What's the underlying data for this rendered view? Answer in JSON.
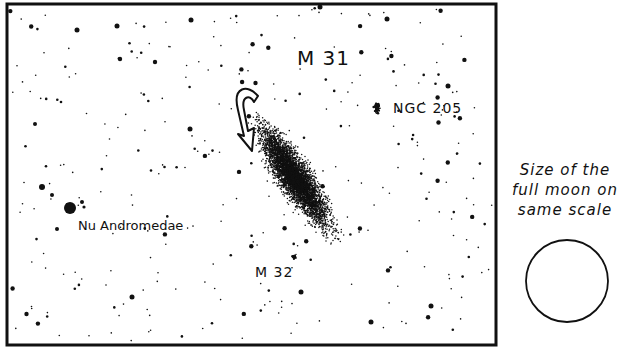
{
  "chart": {
    "labels": {
      "m31": "M 31",
      "ngc205": "NGC 205",
      "nu_andromedae": "Nu Andromedae",
      "m32": "M 32"
    },
    "moon_caption": [
      "Size of the",
      "full moon on",
      "same scale"
    ],
    "colors": {
      "ink": "#111111",
      "background": "#ffffff"
    }
  }
}
